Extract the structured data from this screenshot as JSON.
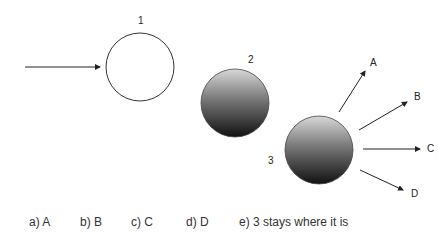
{
  "diagram": {
    "balls": [
      {
        "id": "1",
        "label": "1",
        "fill": "hollow"
      },
      {
        "id": "2",
        "label": "2",
        "fill": "gradient"
      },
      {
        "id": "3",
        "label": "3",
        "fill": "gradient"
      }
    ],
    "directions": [
      {
        "label": "A"
      },
      {
        "label": "B"
      },
      {
        "label": "C"
      },
      {
        "label": "D"
      }
    ]
  },
  "answers": [
    {
      "text": "a) A"
    },
    {
      "text": "b) B"
    },
    {
      "text": "c) C"
    },
    {
      "text": "d) D"
    },
    {
      "text": "e) 3 stays where it is"
    }
  ]
}
